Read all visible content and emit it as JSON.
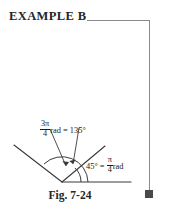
{
  "page": {
    "background_color": "#ffffff",
    "rule_color": "#8a8a8a",
    "ink_color": "#1a1a1a"
  },
  "header": {
    "example_title": "EXAMPLE B"
  },
  "end_marker": {
    "name": "end-of-example-square",
    "color": "#4a4a4a"
  },
  "figure": {
    "caption": "Fig. 7-24",
    "labels": {
      "angle_135": {
        "numerator": "3π",
        "denominator": "4",
        "unit": "rad",
        "equals": "=",
        "degrees": "135°"
      },
      "angle_45": {
        "degrees": "45°",
        "equals": "=",
        "numerator": "π",
        "denominator": "4",
        "unit": "rad"
      }
    },
    "geometry": {
      "vertex": [
        62,
        82
      ],
      "ray_horizontal_end": [
        131,
        82
      ],
      "ray_45_end": [
        105,
        46
      ],
      "ray_135_end": [
        14,
        45
      ],
      "arc_135_radius": 26,
      "arc_45_radius": 19
    }
  }
}
